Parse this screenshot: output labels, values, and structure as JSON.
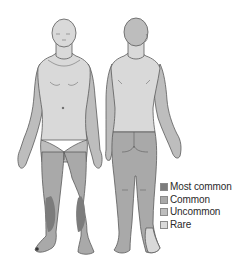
{
  "diagram": {
    "views": [
      "front",
      "back"
    ],
    "colors": {
      "most_common": "#7c7c7c",
      "common": "#a9a9a9",
      "uncommon": "#bdbdbd",
      "rare": "#d9d9d9",
      "outline": "#5a5a5a",
      "background": "#ffffff"
    }
  },
  "legend": {
    "items": [
      {
        "label": "Most common",
        "color": "#7c7c7c"
      },
      {
        "label": "Common",
        "color": "#a9a9a9"
      },
      {
        "label": "Uncommon",
        "color": "#bdbdbd"
      },
      {
        "label": "Rare",
        "color": "#d9d9d9"
      }
    ]
  }
}
